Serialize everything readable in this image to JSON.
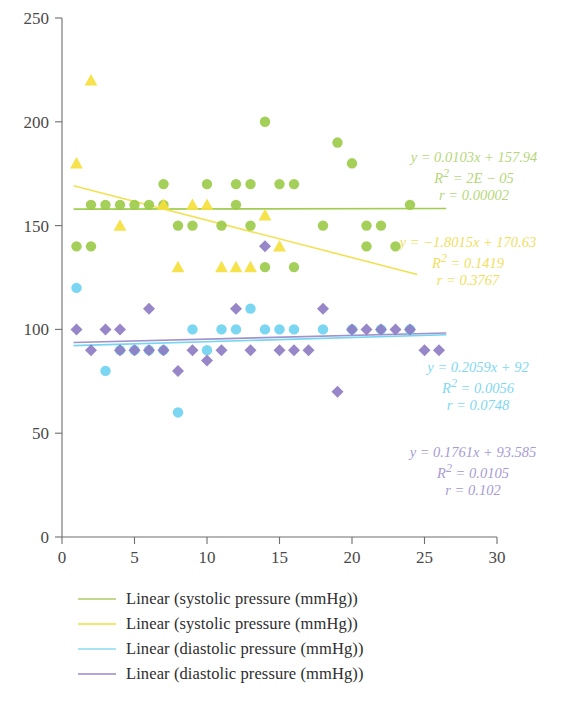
{
  "chart_data": {
    "type": "scatter",
    "title": "",
    "xlabel": "",
    "ylabel": "",
    "xlim": [
      0,
      30
    ],
    "ylim": [
      0,
      250
    ],
    "xticks": [
      "0",
      "5",
      "10",
      "15",
      "20",
      "25",
      "30"
    ],
    "yticks": [
      "0",
      "50",
      "100",
      "150",
      "200",
      "250"
    ],
    "grid": false,
    "legend_position": "bottom-left",
    "series": [
      {
        "name": "systolic pressure (mmHg)",
        "marker": "circle",
        "color": "#9ccb4a",
        "points": [
          [
            1,
            140
          ],
          [
            2,
            160
          ],
          [
            2,
            140
          ],
          [
            3,
            160
          ],
          [
            4,
            160
          ],
          [
            5,
            160
          ],
          [
            6,
            160
          ],
          [
            7,
            170
          ],
          [
            7,
            160
          ],
          [
            8,
            150
          ],
          [
            9,
            150
          ],
          [
            10,
            170
          ],
          [
            11,
            150
          ],
          [
            12,
            170
          ],
          [
            12,
            160
          ],
          [
            13,
            170
          ],
          [
            13,
            150
          ],
          [
            14,
            200
          ],
          [
            14,
            130
          ],
          [
            15,
            170
          ],
          [
            16,
            170
          ],
          [
            16,
            130
          ],
          [
            18,
            150
          ],
          [
            19,
            190
          ],
          [
            20,
            180
          ],
          [
            21,
            150
          ],
          [
            21,
            140
          ],
          [
            22,
            150
          ],
          [
            23,
            140
          ],
          [
            24,
            160
          ]
        ]
      },
      {
        "name": "systolic pressure (mmHg)",
        "marker": "triangle",
        "color": "#f5e03c",
        "points": [
          [
            2,
            220
          ],
          [
            1,
            180
          ],
          [
            4,
            150
          ],
          [
            7,
            160
          ],
          [
            8,
            130
          ],
          [
            9,
            160
          ],
          [
            10,
            160
          ],
          [
            11,
            130
          ],
          [
            12,
            130
          ],
          [
            13,
            130
          ],
          [
            14,
            155
          ],
          [
            15,
            140
          ]
        ]
      },
      {
        "name": "diastolic pressure (mmHg)",
        "marker": "circle",
        "color": "#6fd3f0",
        "points": [
          [
            1,
            120
          ],
          [
            3,
            80
          ],
          [
            4,
            90
          ],
          [
            5,
            90
          ],
          [
            6,
            90
          ],
          [
            7,
            90
          ],
          [
            8,
            60
          ],
          [
            9,
            100
          ],
          [
            10,
            90
          ],
          [
            11,
            100
          ],
          [
            12,
            100
          ],
          [
            13,
            110
          ],
          [
            14,
            100
          ],
          [
            15,
            100
          ],
          [
            16,
            100
          ],
          [
            18,
            100
          ],
          [
            20,
            100
          ],
          [
            22,
            100
          ],
          [
            24,
            100
          ]
        ]
      },
      {
        "name": "diastolic pressure (mmHg)",
        "marker": "diamond",
        "color": "#8e7cc3",
        "points": [
          [
            1,
            100
          ],
          [
            2,
            90
          ],
          [
            3,
            100
          ],
          [
            4,
            90
          ],
          [
            4,
            100
          ],
          [
            5,
            90
          ],
          [
            6,
            110
          ],
          [
            6,
            90
          ],
          [
            7,
            90
          ],
          [
            8,
            80
          ],
          [
            9,
            90
          ],
          [
            10,
            85
          ],
          [
            11,
            90
          ],
          [
            12,
            110
          ],
          [
            13,
            90
          ],
          [
            14,
            140
          ],
          [
            15,
            90
          ],
          [
            16,
            90
          ],
          [
            17,
            90
          ],
          [
            18,
            110
          ],
          [
            19,
            70
          ],
          [
            20,
            100
          ],
          [
            21,
            100
          ],
          [
            22,
            100
          ],
          [
            23,
            100
          ],
          [
            24,
            100
          ],
          [
            25,
            90
          ],
          [
            26,
            90
          ]
        ]
      }
    ],
    "trendlines": [
      {
        "name": "Linear (systolic pressure (mmHg))",
        "color": "#9ccb4a",
        "slope": 0.0103,
        "intercept": 157.94,
        "x_from": 0.8,
        "x_to": 26.5,
        "equation": "y = 0.0103x + 157.94",
        "r_squared_label": "R",
        "r_squared_exp": "2",
        "r_squared_value": "= 2E − 05",
        "r_label": "r = 0.00002"
      },
      {
        "name": "Linear (systolic pressure (mmHg))",
        "color": "#f1e04a",
        "slope": -1.8015,
        "intercept": 170.63,
        "x_from": 0.8,
        "x_to": 24.5,
        "equation": "y = −1.8015x + 170.63",
        "r_squared_label": "R",
        "r_squared_exp": "2",
        "r_squared_value": "= 0.1419",
        "r_label": "r = 0.3767"
      },
      {
        "name": "Linear (diastolic pressure (mmHg))",
        "color": "#6fd3f0",
        "slope": 0.2059,
        "intercept": 92,
        "x_from": 0.8,
        "x_to": 26.5,
        "equation": "y = 0.2059x + 92",
        "r_squared_label": "R",
        "r_squared_exp": "2",
        "r_squared_value": "= 0.0056",
        "r_label": "r = 0.0748"
      },
      {
        "name": "Linear (diastolic pressure (mmHg))",
        "color": "#9b8ec9",
        "slope": 0.1761,
        "intercept": 93.585,
        "x_from": 0.8,
        "x_to": 26.5,
        "equation": "y = 0.1761x + 93.585",
        "r_squared_label": "R",
        "r_squared_exp": "2",
        "r_squared_value": "= 0.0105",
        "r_label": "r = 0.102"
      }
    ]
  },
  "equations": {
    "green": {
      "line1": "y = 0.0103x + 157.94",
      "line2_base": "R",
      "line2_exp": "2",
      "line2_rest": " = 2E − 05",
      "line3": "r = 0.00002",
      "color": "#b6d77a"
    },
    "yellow": {
      "line1": "y = −1.8015x + 170.63",
      "line2_base": "R",
      "line2_exp": "2",
      "line2_rest": " = 0.1419",
      "line3": "r = 0.3767",
      "color": "#efe05f"
    },
    "cyan": {
      "line1": "y = 0.2059x + 92",
      "line2_base": "R",
      "line2_exp": "2",
      "line2_rest": " = 0.0056",
      "line3": "r = 0.0748",
      "color": "#7fd8f2"
    },
    "purple": {
      "line1": "y = 0.1761x + 93.585",
      "line2_base": "R",
      "line2_exp": "2",
      "line2_rest": " = 0.0105",
      "line3": "r = 0.102",
      "color": "#a79bd3"
    }
  },
  "legend": {
    "items": [
      {
        "label": "Linear (systolic pressure (mmHg))",
        "color": "#c3d98a"
      },
      {
        "label": "Linear (systolic pressure (mmHg))",
        "color": "#f3e76e"
      },
      {
        "label": "Linear (diastolic pressure (mmHg))",
        "color": "#a8e4f3"
      },
      {
        "label": "Linear (diastolic pressure (mmHg))",
        "color": "#b3a6d8"
      }
    ]
  },
  "axis": {
    "x_ticks": [
      "0",
      "5",
      "10",
      "15",
      "20",
      "25",
      "30"
    ],
    "y_ticks": [
      "250",
      "200",
      "150",
      "100",
      "50",
      "0"
    ]
  }
}
